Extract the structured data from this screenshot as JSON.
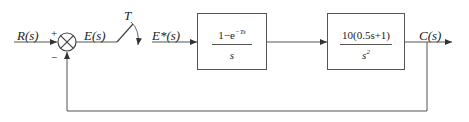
{
  "diagram": {
    "type": "sampled-data feedback control block diagram",
    "input_label": "R(s)",
    "sum_junction": {
      "plus_sign": "+",
      "minus_sign": "−"
    },
    "error_label": "E(s)",
    "sampler": {
      "period_label": "T"
    },
    "sampled_error_label": "E*(s)",
    "block1": {
      "name": "zero-order hold",
      "numerator_prefix": "1−e",
      "numerator_exponent": "−Ts",
      "denominator": "s"
    },
    "block2": {
      "name": "plant",
      "numerator": "10(0.5s+1)",
      "denominator_base": "s",
      "denominator_exponent": "2"
    },
    "output_label": "C(s)",
    "feedback": "unity negative feedback",
    "colors": {
      "line": "#555555",
      "text": "#222222",
      "background": "#ffffff"
    }
  }
}
